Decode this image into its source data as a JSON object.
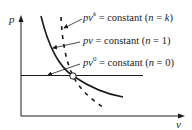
{
  "diagram": {
    "type": "p-v polytropic process curves",
    "axes": {
      "y_label": "p",
      "x_label": "v"
    },
    "curves": [
      {
        "id": "n-k",
        "style": "dashed",
        "label": {
          "prefix": "pv",
          "exponent": "k",
          "equation": " = constant (",
          "n_var": "n",
          "n_eq": " = ",
          "n_val": "k",
          "close": ")"
        }
      },
      {
        "id": "n-1",
        "style": "solid",
        "label": {
          "prefix": "pv",
          "exponent": "",
          "equation": " = constant (",
          "n_var": "n",
          "n_eq": " = ",
          "n_val": "1",
          "close": ")"
        }
      },
      {
        "id": "n-0",
        "style": "solid-horizontal",
        "label": {
          "prefix": "pv",
          "exponent": "0",
          "equation": " = constant (",
          "n_var": "n",
          "n_eq": " = ",
          "n_val": "0",
          "close": ")"
        }
      }
    ],
    "intersection_marker": "open-circle",
    "colors": {
      "line": "#1a1a1a",
      "background": "#ffffff"
    }
  }
}
